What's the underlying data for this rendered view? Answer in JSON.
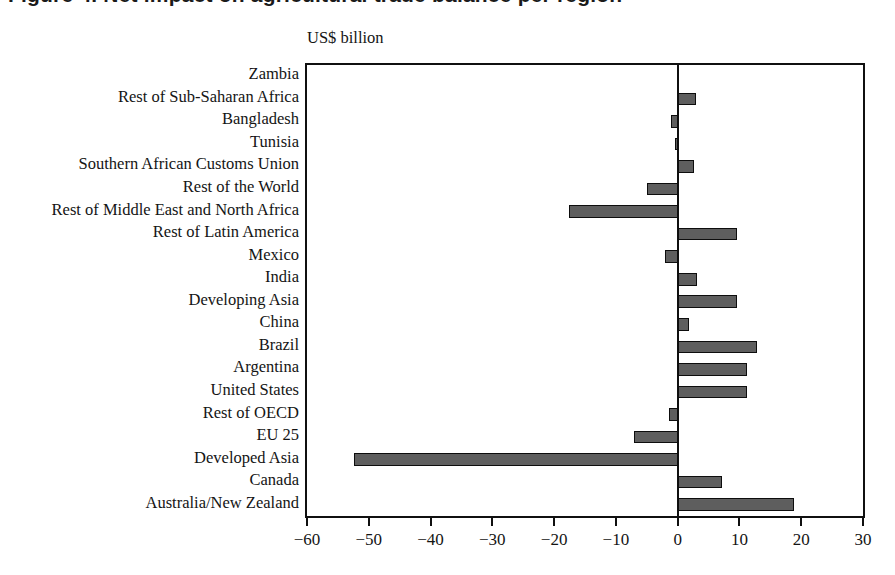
{
  "figure": {
    "title_partial": "Figure 4.  Net impact on agricultural trade balance per region",
    "unit_caption": "US$ billion"
  },
  "chart_data": {
    "type": "bar",
    "orientation": "horizontal",
    "title": "US$ billion",
    "xlabel": "",
    "ylabel": "",
    "unit": "US$ billion",
    "xlim": [
      -60,
      30
    ],
    "xticks": [
      -60,
      -50,
      -40,
      -30,
      -20,
      -10,
      0,
      10,
      20,
      30
    ],
    "xtick_labels": [
      "−60",
      "−50",
      "−40",
      "−30",
      "−20",
      "−10",
      "0",
      "10",
      "20",
      "30"
    ],
    "grid": false,
    "legend": false,
    "zero_line": 0,
    "bar_fill_color": "#5e5e5e",
    "bar_edge_color": "#0d0d0d",
    "categories": [
      "Zambia",
      "Rest of Sub-Saharan Africa",
      "Bangladesh",
      "Tunisia",
      "Southern African Customs Union",
      "Rest of the World",
      "Rest of Middle East and North Africa",
      "Rest of Latin America",
      "Mexico",
      "India",
      "Developing Asia",
      "China",
      "Brazil",
      "Argentina",
      "United States",
      "Rest of OECD",
      "EU 25",
      "Developed Asia",
      "Canada",
      "Australia/New Zealand"
    ],
    "values": [
      0.0,
      2.9,
      -1.1,
      -0.5,
      2.6,
      -5.0,
      -17.6,
      9.6,
      -2.1,
      3.1,
      9.6,
      1.8,
      12.8,
      11.3,
      11.3,
      -1.4,
      -7.1,
      -52.4,
      7.2,
      18.8
    ]
  }
}
